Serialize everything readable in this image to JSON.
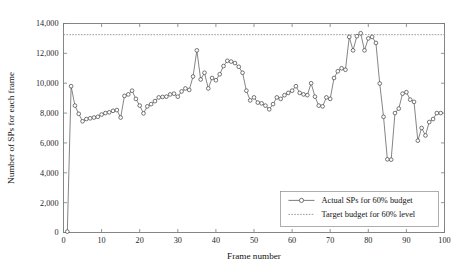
{
  "chart_data": {
    "type": "line",
    "title": "",
    "xlabel": "Frame number",
    "ylabel": "Number of SPs for each frame",
    "xlim": [
      0,
      100
    ],
    "ylim": [
      0,
      14000
    ],
    "xticks": [
      0,
      10,
      20,
      30,
      40,
      50,
      60,
      70,
      80,
      90,
      100
    ],
    "xtick_labels": [
      "0",
      "10",
      "20",
      "30",
      "40",
      "50",
      "60",
      "70",
      "80",
      "90",
      "100"
    ],
    "yticks": [
      0,
      2000,
      4000,
      6000,
      8000,
      10000,
      12000,
      14000
    ],
    "ytick_labels": [
      "0",
      "2,000",
      "4,000",
      "6,000",
      "8,000",
      "10,000",
      "12,000",
      "14,000"
    ],
    "grid": false,
    "legend_position": "lower right",
    "legend_entries": [
      {
        "label": "Actual SPs for 60% budget",
        "style": "line-marker",
        "marker": "circle",
        "color": "#5c5c5c"
      },
      {
        "label": "Target budget for 60% level",
        "style": "dashed",
        "color": "#8e8e8e"
      }
    ],
    "series": [
      {
        "name": "Actual SPs for 60% budget",
        "marker": "circle",
        "color": "#5c5c5c",
        "x": [
          1,
          2,
          3,
          4,
          5,
          6,
          7,
          8,
          9,
          10,
          11,
          12,
          13,
          14,
          15,
          16,
          17,
          18,
          19,
          20,
          21,
          22,
          23,
          24,
          25,
          26,
          27,
          28,
          29,
          30,
          31,
          32,
          33,
          34,
          35,
          36,
          37,
          38,
          39,
          40,
          41,
          42,
          43,
          44,
          45,
          46,
          47,
          48,
          49,
          50,
          51,
          52,
          53,
          54,
          55,
          56,
          57,
          58,
          59,
          60,
          61,
          62,
          63,
          64,
          65,
          66,
          67,
          68,
          69,
          70,
          71,
          72,
          73,
          74,
          75,
          76,
          77,
          78,
          79,
          80,
          81,
          82,
          83,
          84,
          85,
          86,
          87,
          88,
          89,
          90,
          91,
          92,
          93,
          94,
          95,
          96,
          97,
          98,
          99
        ],
        "y": [
          60,
          9800,
          8500,
          7950,
          7450,
          7600,
          7650,
          7700,
          7750,
          7900,
          8000,
          8050,
          8150,
          8200,
          7700,
          9150,
          9250,
          9500,
          8950,
          8500,
          7980,
          8450,
          8600,
          8800,
          9050,
          9080,
          9100,
          9250,
          9300,
          9100,
          9450,
          9650,
          9550,
          10450,
          12200,
          10250,
          10700,
          9650,
          10350,
          10200,
          10600,
          11150,
          11500,
          11450,
          11350,
          11100,
          10700,
          9500,
          8850,
          9050,
          8700,
          8650,
          8500,
          8250,
          8600,
          9050,
          8950,
          9200,
          9350,
          9500,
          9800,
          9350,
          9250,
          9200,
          10000,
          9100,
          8500,
          8450,
          9050,
          8950,
          10350,
          10800,
          11000,
          10900,
          13100,
          12200,
          13150,
          13350,
          12200,
          13000,
          13100,
          12700,
          9980,
          7750,
          4900,
          4880,
          8000,
          8300,
          9300,
          9400,
          8900,
          8750,
          6150,
          7000,
          6500,
          7400,
          7600,
          8000,
          8000
        ]
      }
    ],
    "reference_lines": [
      {
        "name": "Target budget for 60% level",
        "value": 13250,
        "style": "dashed",
        "color": "#8e8e8e"
      }
    ]
  }
}
